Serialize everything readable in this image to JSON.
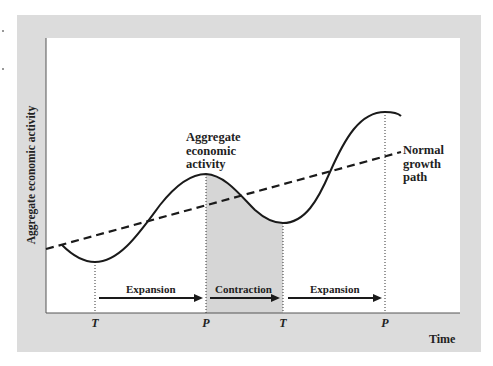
{
  "figure": {
    "y_axis_label": "Aggregate economic activity",
    "x_axis_label": "Time",
    "curve_label": [
      "Aggregate",
      "economic",
      "activity"
    ],
    "trend_label": [
      "Normal",
      "growth",
      "path"
    ],
    "phases": [
      {
        "label": "Expansion",
        "from": "T",
        "to": "P",
        "shaded": false
      },
      {
        "label": "Contraction",
        "from": "P",
        "to": "T",
        "shaded": true
      },
      {
        "label": "Expansion",
        "from": "T",
        "to": "P",
        "shaded": false
      }
    ],
    "turning_points": [
      {
        "label": "T",
        "meaning": "trough"
      },
      {
        "label": "P",
        "meaning": "peak"
      },
      {
        "label": "T",
        "meaning": "trough"
      },
      {
        "label": "P",
        "meaning": "peak"
      }
    ],
    "colors": {
      "frame": "#dcdcdc",
      "plot_background": "#ffffff",
      "contraction_shade": "#d6d6d6",
      "lines": "#1a1a1a"
    }
  }
}
